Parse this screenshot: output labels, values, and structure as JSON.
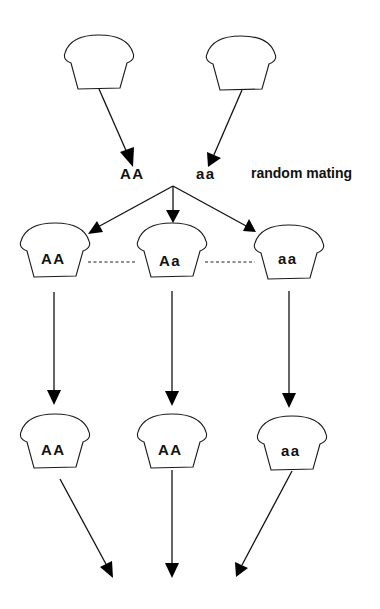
{
  "diagram": {
    "title": "",
    "parents": [
      {
        "id": "parent-left",
        "genotype": "AA"
      },
      {
        "id": "parent-right",
        "genotype": "aa"
      }
    ],
    "mating_label": "random mating",
    "generation_1": [
      {
        "id": "g1-left",
        "genotype": "AA"
      },
      {
        "id": "g1-center",
        "genotype": "Aa"
      },
      {
        "id": "g1-right",
        "genotype": "aa"
      }
    ],
    "generation_2": [
      {
        "id": "g2-left",
        "genotype": "AA"
      },
      {
        "id": "g2-center",
        "genotype": "AA"
      },
      {
        "id": "g2-right",
        "genotype": "aa"
      }
    ],
    "colors": {
      "stroke": "#111111",
      "background": "#ffffff"
    }
  }
}
